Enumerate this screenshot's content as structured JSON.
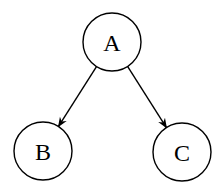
{
  "diagram": {
    "type": "tree",
    "nodes": [
      {
        "id": "A",
        "label": "A",
        "cx": 112,
        "cy": 42,
        "r": 29
      },
      {
        "id": "B",
        "label": "B",
        "cx": 43,
        "cy": 151,
        "r": 29
      },
      {
        "id": "C",
        "label": "C",
        "cx": 182,
        "cy": 152,
        "r": 29
      }
    ],
    "edges": [
      {
        "from": "A",
        "to": "B",
        "directed": true
      },
      {
        "from": "A",
        "to": "C",
        "directed": true
      }
    ],
    "colors": {
      "stroke": "#000000",
      "fill": "#ffffff",
      "background": "#ffffff"
    }
  }
}
